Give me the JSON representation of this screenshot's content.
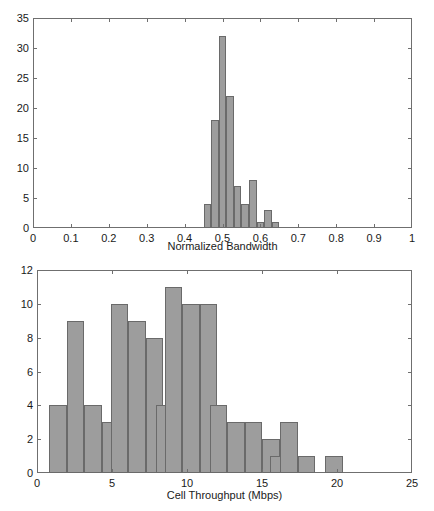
{
  "figure": {
    "background": "#ffffff",
    "bar_fill": "#9d9d9d",
    "bar_edge": "#6a6a6a",
    "axis_color": "#6f6f6f"
  },
  "chart_data": [
    {
      "type": "bar",
      "subtype": "histogram",
      "title": "",
      "xlabel": "Normalized Bandwidth",
      "ylabel": "",
      "xlim": [
        0,
        1
      ],
      "ylim": [
        0,
        35
      ],
      "grid": false,
      "legend": null,
      "xticks": [
        0,
        0.1,
        0.2,
        0.3,
        0.4,
        0.5,
        0.6,
        0.7,
        0.8,
        0.9,
        1
      ],
      "xticklabels": [
        "0",
        "0.1",
        "0.2",
        "0.3",
        "0.4",
        "0.5",
        "0.6",
        "0.7",
        "0.8",
        "0.9",
        "1"
      ],
      "yticks": [
        0,
        5,
        10,
        15,
        20,
        25,
        30,
        35
      ],
      "yticklabels": [
        "0",
        "5",
        "10",
        "15",
        "20",
        "25",
        "30",
        "35"
      ],
      "bin_width": 0.02,
      "bin_starts": [
        0.45,
        0.47,
        0.49,
        0.51,
        0.53,
        0.55,
        0.57,
        0.59,
        0.61,
        0.63
      ],
      "bin_centers": [
        0.46,
        0.48,
        0.5,
        0.52,
        0.54,
        0.56,
        0.58,
        0.6,
        0.62,
        0.64
      ],
      "values": [
        4,
        18,
        32,
        22,
        7,
        4,
        8,
        1,
        3,
        1
      ]
    },
    {
      "type": "bar",
      "subtype": "histogram",
      "title": "",
      "xlabel": "Cell Throughput (Mbps)",
      "ylabel": "",
      "xlim": [
        0,
        25
      ],
      "ylim": [
        0,
        12
      ],
      "grid": false,
      "legend": null,
      "xticks": [
        0,
        5,
        10,
        15,
        20,
        25
      ],
      "xticklabels": [
        "0",
        "5",
        "10",
        "15",
        "20",
        "25"
      ],
      "yticks": [
        0,
        2,
        4,
        6,
        8,
        10,
        12
      ],
      "yticklabels": [
        "0",
        "2",
        "4",
        "6",
        "8",
        "10",
        "12"
      ],
      "bin_width": 1.17,
      "bin_starts": [
        0.8,
        1.97,
        3.14,
        4.31,
        4.9,
        6.07,
        7.24,
        7.9,
        8.5,
        9.67,
        10.84,
        11.5,
        12.67,
        13.84,
        15.01,
        15.5,
        16.2,
        17.37,
        19.2
      ],
      "bin_centers": [
        1.4,
        2.5,
        3.7,
        4.3,
        5.5,
        6.6,
        7.5,
        8.3,
        9.0,
        10.2,
        11.3,
        12.1,
        13.3,
        14.4,
        15.5,
        16.0,
        16.8,
        17.9,
        19.8
      ],
      "values": [
        4,
        9,
        4,
        3,
        10,
        9,
        8,
        4,
        11,
        10,
        10,
        4,
        3,
        3,
        2,
        1,
        3,
        1,
        1
      ]
    }
  ]
}
